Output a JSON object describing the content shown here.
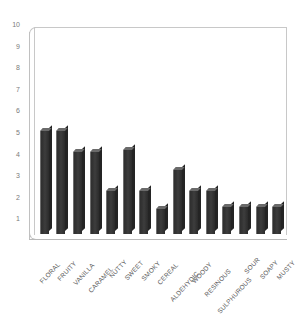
{
  "chart_data": {
    "type": "bar",
    "title": "",
    "subtitle": "",
    "xlabel": "",
    "ylabel": "",
    "ylim": [
      0,
      10
    ],
    "yticks": [
      10,
      9,
      8,
      7,
      6,
      5,
      4,
      3,
      2,
      1
    ],
    "grid": false,
    "legend": "none",
    "bar_color": "#3b3b3b",
    "frame_color": "#c8c8c8",
    "tick_label_color": "#7b7b7b",
    "category_label_color": "#5d5d5d",
    "background": "#ffffff",
    "categories": [
      "FLORAL",
      "FRUITY",
      "VANILLA",
      "CARAMEL",
      "NUTTY",
      "SWEET",
      "SMOKY",
      "CEREAL",
      "ALDEHYDIC",
      "WOODY",
      "RESINOUS",
      "SULPHUROUS",
      "SOUR",
      "SOAPY",
      "MUSTY"
    ],
    "values": [
      5.0,
      5.0,
      4.0,
      4.0,
      2.1,
      4.1,
      2.1,
      1.2,
      3.1,
      2.1,
      2.1,
      1.3,
      1.3,
      1.3,
      1.3
    ]
  }
}
